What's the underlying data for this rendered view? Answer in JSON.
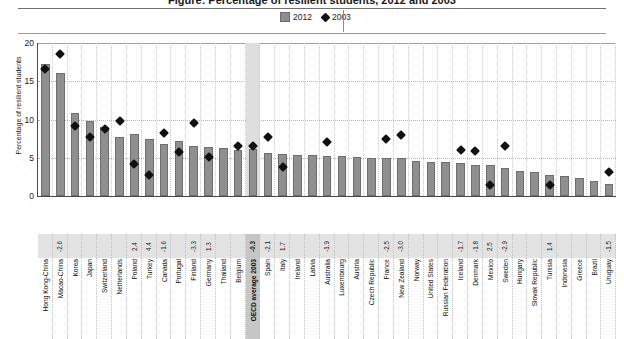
{
  "header": {
    "title_partial": "Figure: Percentage of resilient students, 2012 and 2003"
  },
  "legend": {
    "items": [
      {
        "label": "2012",
        "marker": "bar-swatch-icon",
        "color": "#8f8f8f"
      },
      {
        "label": "2003",
        "marker": "diamond-marker-icon",
        "color": "#111111"
      }
    ]
  },
  "chart_data": {
    "type": "bar",
    "title": "Percentage of resilient students",
    "xlabel": "",
    "ylabel": "Percentage of resilient students",
    "ylim": [
      0,
      20
    ],
    "yticks": [
      0,
      5,
      10,
      15,
      20
    ],
    "grid": true,
    "legend_position": "top-center",
    "highlight_category": "OECD average 2003",
    "categories": [
      "Hong Kong-China",
      "Macao-China",
      "Korea",
      "Japan",
      "Switzerland",
      "Netherlands",
      "Poland",
      "Turkey",
      "Canada",
      "Portugal",
      "Finland",
      "Germany",
      "Thailand",
      "Belgium",
      "OECD average 2003",
      "Spain",
      "Italy",
      "Ireland",
      "Latvia",
      "Australia",
      "Luxembourg",
      "Austria",
      "Czech Republic",
      "France",
      "New Zealand",
      "Norway",
      "United States",
      "Russian Federation",
      "Iceland",
      "Denmark",
      "Mexico",
      "Sweden",
      "Hungary",
      "Slovak Republic",
      "Tunisia",
      "Indonesia",
      "Greece",
      "Brazil",
      "Uruguay"
    ],
    "series": [
      {
        "name": "2012",
        "type": "bar",
        "color": "#8f8f8f",
        "values": [
          17.2,
          16.1,
          10.8,
          9.8,
          9.0,
          7.7,
          8.1,
          7.4,
          6.8,
          7.2,
          6.5,
          6.4,
          6.3,
          6.0,
          6.2,
          5.6,
          5.5,
          5.3,
          5.3,
          5.2,
          5.2,
          5.1,
          5.0,
          5.0,
          5.0,
          4.6,
          4.5,
          4.4,
          4.3,
          4.1,
          4.0,
          3.6,
          3.3,
          3.2,
          2.8,
          2.6,
          2.4,
          1.9,
          1.6
        ]
      },
      {
        "name": "2003",
        "type": "scatter",
        "marker": "diamond",
        "color": "#111111",
        "values": [
          16.6,
          18.6,
          9.2,
          7.7,
          8.8,
          9.8,
          4.2,
          2.7,
          8.2,
          5.8,
          9.6,
          5.1,
          null,
          6.5,
          6.5,
          7.7,
          3.8,
          null,
          null,
          7.1,
          null,
          null,
          null,
          7.5,
          8.0,
          null,
          null,
          null,
          6.0,
          5.9,
          1.5,
          6.5,
          null,
          null,
          1.4,
          null,
          null,
          null,
          3.1
        ]
      }
    ],
    "difference_labels": {
      "description": "Change in percentage of resilient students between 2003 and 2012",
      "values": {
        "Macao-China": "-2.6",
        "Poland": "2.4",
        "Turkey": "4.4",
        "Canada": "-1.6",
        "Finland": "-3.3",
        "Germany": "1.3",
        "OECD average 2003": "-0.3",
        "Spain": "-2.1",
        "Italy": "1.7",
        "Australia": "-1.9",
        "France": "-2.5",
        "New Zealand": "-3.0",
        "Iceland": "-1.7",
        "Denmark": "-1.8",
        "Mexico": "2.5",
        "Sweden": "-2.9",
        "Tunisia": "1.4",
        "Uruguay": "-1.5"
      }
    }
  }
}
